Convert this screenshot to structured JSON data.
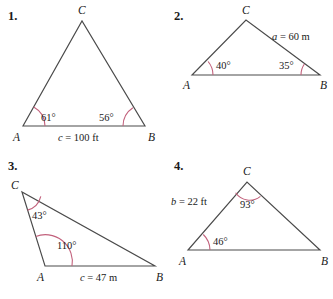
{
  "page": {
    "background": "#ffffff",
    "line_color": "#4a4a4a",
    "arc_color": "#c2617c",
    "text_color": "#1a1a1a"
  },
  "problems": [
    {
      "number": "1.",
      "vertices": {
        "A": "A",
        "B": "B",
        "C": "C"
      },
      "angles": [
        {
          "at": "A",
          "text": "61°"
        },
        {
          "at": "B",
          "text": "56°"
        }
      ],
      "sides": [
        {
          "name": "c",
          "value": "100",
          "unit": "ft",
          "text": "c = 100 ft"
        }
      ]
    },
    {
      "number": "2.",
      "vertices": {
        "A": "A",
        "B": "B",
        "C": "C"
      },
      "angles": [
        {
          "at": "A",
          "text": "40°"
        },
        {
          "at": "B",
          "text": "35°"
        }
      ],
      "sides": [
        {
          "name": "a",
          "value": "60",
          "unit": "m",
          "text": "a = 60 m"
        }
      ]
    },
    {
      "number": "3.",
      "vertices": {
        "A": "A",
        "B": "B",
        "C": "C"
      },
      "angles": [
        {
          "at": "C",
          "text": "43°"
        },
        {
          "at": "A",
          "text": "110°"
        }
      ],
      "sides": [
        {
          "name": "c",
          "value": "47",
          "unit": "m",
          "text": "c = 47 m"
        }
      ]
    },
    {
      "number": "4.",
      "vertices": {
        "A": "A",
        "B": "B",
        "C": "C"
      },
      "angles": [
        {
          "at": "C",
          "text": "93°"
        },
        {
          "at": "A",
          "text": "46°"
        }
      ],
      "sides": [
        {
          "name": "b",
          "value": "22",
          "unit": "ft",
          "text": "b = 22 ft"
        }
      ]
    }
  ]
}
